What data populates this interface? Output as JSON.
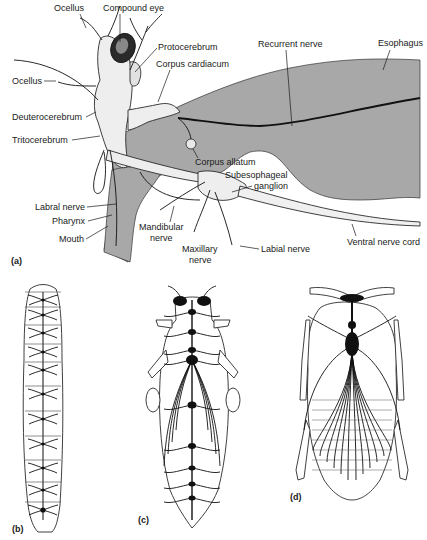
{
  "figure": {
    "colors": {
      "gut_fill": "#a8a8a8",
      "line": "#1a1a1a",
      "tissue_fill": "#f2f2f2",
      "background": "#ffffff"
    },
    "panels": [
      {
        "id": "a",
        "label": "(a)",
        "description": "Lateral view of insect head nervous system"
      },
      {
        "id": "b",
        "label": "(b)",
        "description": "Larval ventral nerve cord with segmental ganglia"
      },
      {
        "id": "c",
        "label": "(c)",
        "description": "Nervous system with partially fused ganglia"
      },
      {
        "id": "d",
        "label": "(d)",
        "description": "Nervous system with highly fused thoracic ganglion"
      }
    ],
    "labels": {
      "ocellus_top": "Ocellus",
      "compound_eye": "Compound eye",
      "protocerebrum": "Protocerebrum",
      "corpus_cardiacum": "Corpus cardiacum",
      "recurrent_nerve": "Recurrent nerve",
      "esophagus": "Esophagus",
      "ocellus_side": "Ocellus",
      "deuterocerebrum": "Deuterocerebrum",
      "tritocerebrum": "Tritocerebrum",
      "corpus_allatum": "Corpus allatum",
      "subesophageal_1": "Subesophageal",
      "subesophageal_2": "ganglion",
      "labral_nerve": "Labral nerve",
      "pharynx": "Pharynx",
      "mouth": "Mouth",
      "mandibular_1": "Mandibular",
      "mandibular_2": "nerve",
      "maxillary_1": "Maxillary",
      "maxillary_2": "nerve",
      "labial_nerve": "Labial nerve",
      "ventral_nerve_cord": "Ventral nerve cord"
    }
  }
}
